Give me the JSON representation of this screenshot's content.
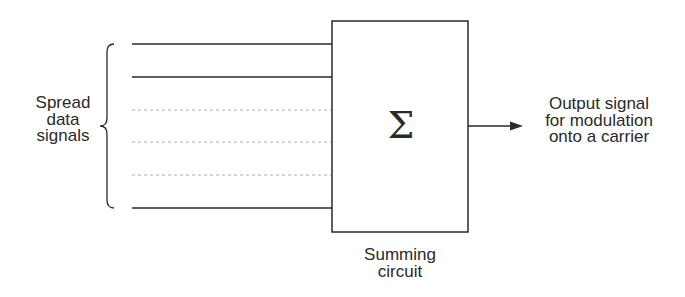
{
  "diagram": {
    "input_label": [
      "Spread",
      "data",
      "signals"
    ],
    "input_signals": [
      {
        "style": "solid"
      },
      {
        "style": "solid"
      },
      {
        "style": "dotted"
      },
      {
        "style": "dotted"
      },
      {
        "style": "dotted"
      },
      {
        "style": "solid"
      }
    ],
    "summing_block": {
      "symbol": "Σ",
      "label": [
        "Summing",
        "circuit"
      ]
    },
    "output_label": [
      "Output signal",
      "for modulation",
      "onto a carrier"
    ],
    "colors": {
      "line": "#2a2a2a",
      "dotted_line": "#9a9a9a",
      "background": "#ffffff"
    }
  }
}
